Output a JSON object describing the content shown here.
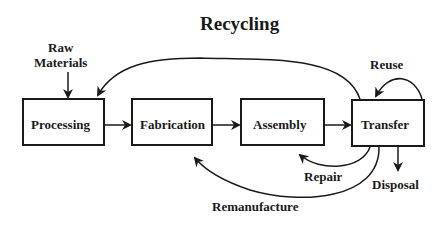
{
  "title": "Recycling",
  "inputs": {
    "raw_materials": "Raw\nMaterials",
    "raw_line1": "Raw",
    "raw_line2": "Materials"
  },
  "stages": [
    {
      "id": "processing",
      "label": "Processing"
    },
    {
      "id": "fabrication",
      "label": "Fabrication"
    },
    {
      "id": "assembly",
      "label": "Assembly"
    },
    {
      "id": "transfer",
      "label": "Transfer"
    }
  ],
  "loops": {
    "reuse": "Reuse",
    "repair": "Repair",
    "remanufacture": "Remanufacture",
    "disposal": "Disposal"
  },
  "edges": [
    {
      "from": "raw_materials",
      "to": "processing"
    },
    {
      "from": "processing",
      "to": "fabrication"
    },
    {
      "from": "fabrication",
      "to": "assembly"
    },
    {
      "from": "assembly",
      "to": "transfer"
    },
    {
      "from": "transfer",
      "to": "processing",
      "label": "recycling"
    },
    {
      "from": "transfer",
      "to": "transfer",
      "label": "Reuse"
    },
    {
      "from": "transfer",
      "to": "assembly",
      "label": "Repair"
    },
    {
      "from": "transfer",
      "to": "fabrication",
      "label": "Remanufacture"
    },
    {
      "from": "transfer",
      "to": "disposal",
      "label": "Disposal"
    }
  ],
  "colors": {
    "stroke": "#1a1a1a",
    "background": "#ffffff"
  }
}
